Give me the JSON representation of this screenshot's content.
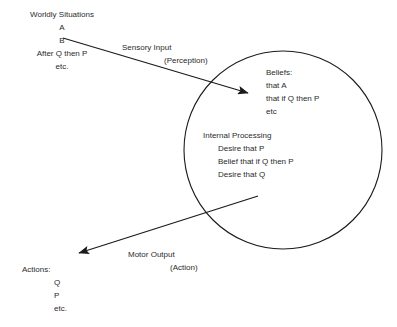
{
  "diagram": {
    "background_color": "#ffffff",
    "stroke_color": "#1a1a1a",
    "text_color": "#2b2b2b",
    "worldly_situations": {
      "heading": "Worldly Situations",
      "items": [
        "A",
        "B",
        "After Q then P",
        "etc."
      ]
    },
    "sensory_input": {
      "label": "Sensory Input",
      "sublabel": "(Perception)"
    },
    "beliefs": {
      "heading": "Beliefs:",
      "items": [
        "that A",
        "that if Q then P",
        "etc"
      ]
    },
    "internal_processing": {
      "heading": "Internal Processing",
      "items": [
        "Desire that P",
        "Belief that if Q then P",
        "Desire that Q"
      ]
    },
    "motor_output": {
      "label": "Motor Output",
      "sublabel": "(Action)"
    },
    "actions": {
      "heading": "Actions:",
      "items": [
        "Q",
        "P",
        "etc."
      ]
    },
    "mind_circle": {
      "name": "mind-boundary-circle",
      "center_x": 283,
      "center_y": 150,
      "radius": 99
    }
  }
}
